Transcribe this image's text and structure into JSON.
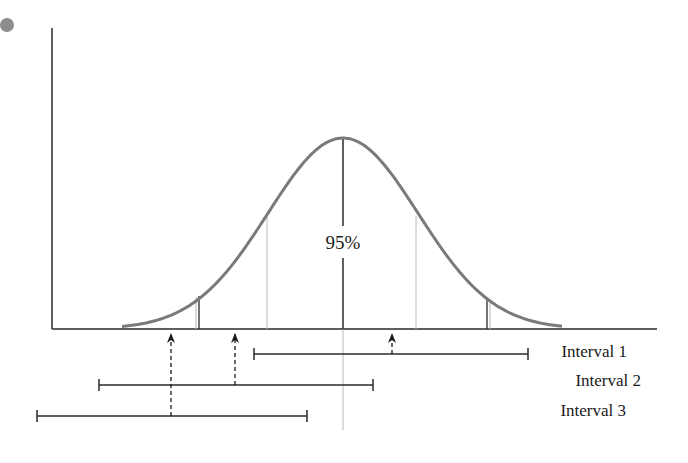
{
  "diagram": {
    "center_label": "95%",
    "colors": {
      "curve": "#7a7a7a",
      "axis": "#2a2a2a",
      "guide": "#b8b8b8",
      "bullet": "#8c8c8c",
      "text": "#1a1a1a"
    },
    "intervals": [
      {
        "label": "Interval 1",
        "x1": 254,
        "x2": 528,
        "y": 354,
        "arrow_x": 392
      },
      {
        "label": "Interval 2",
        "x1": 99,
        "x2": 373,
        "y": 385,
        "arrow_x": 235
      },
      {
        "label": "Interval 3",
        "x1": 37,
        "x2": 307,
        "y": 416,
        "arrow_x": 171
      }
    ]
  },
  "chart_data": {
    "type": "line",
    "title": "",
    "curve": {
      "mean_x": 343,
      "peak_y": 138,
      "baseline_y": 329,
      "x_start": 122,
      "x_end": 562
    },
    "annotations": [
      "95%",
      "Interval 1",
      "Interval 2",
      "Interval 3"
    ],
    "intervals": [
      {
        "name": "Interval 1",
        "low": 254,
        "high": 528,
        "point": 392,
        "contains_mean": true
      },
      {
        "name": "Interval 2",
        "low": 99,
        "high": 373,
        "point": 235,
        "contains_mean": true
      },
      {
        "name": "Interval 3",
        "low": 37,
        "high": 307,
        "point": 171,
        "contains_mean": false
      }
    ],
    "grid": false
  }
}
